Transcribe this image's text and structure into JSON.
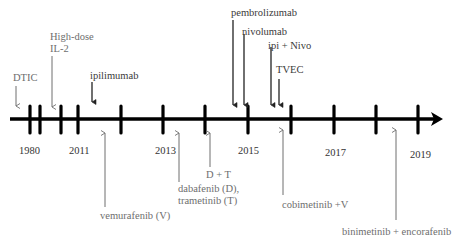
{
  "diagram": {
    "type": "timeline",
    "axis": {
      "y": 119,
      "x_start": 10,
      "x_end": 443,
      "color": "#000000"
    },
    "ticks_x": [
      30,
      40,
      61,
      78,
      121,
      163,
      205,
      248,
      291,
      334,
      376,
      418
    ],
    "year_labels": [
      {
        "text": "1980",
        "x": 19,
        "y": 145
      },
      {
        "text": "2011",
        "x": 69,
        "y": 145
      },
      {
        "text": "2013",
        "x": 155,
        "y": 145
      },
      {
        "text": "2015",
        "x": 238,
        "y": 145
      },
      {
        "text": "2017",
        "x": 325,
        "y": 147
      },
      {
        "text": "2019",
        "x": 410,
        "y": 149
      }
    ],
    "above": [
      {
        "lines": [
          "DTIC"
        ],
        "x": 14,
        "y": 72,
        "arrow_x": 16,
        "arrow_y1": 86,
        "arrow_y2": 106,
        "color": "#6e6e6e"
      },
      {
        "lines": [
          "High-dose",
          "IL-2"
        ],
        "x": 50,
        "y": 31,
        "arrow_x": 52,
        "arrow_y1": 56,
        "arrow_y2": 107,
        "color": "#6e6e6e"
      },
      {
        "lines": [
          "ipilimumab"
        ],
        "x": 90,
        "y": 70,
        "arrow_x": 92,
        "arrow_y1": 82,
        "arrow_y2": 102,
        "color": "#222222"
      },
      {
        "lines": [
          "pembrolizumab"
        ],
        "x": 231,
        "y": 7,
        "arrow_x": 233,
        "arrow_y1": 20,
        "arrow_y2": 105,
        "color": "#222222"
      },
      {
        "lines": [
          "nivolumab"
        ],
        "x": 243,
        "y": 26,
        "arrow_x": 244,
        "arrow_y1": 34,
        "arrow_y2": 105,
        "color": "#222222"
      },
      {
        "lines": [
          "ipi + Nivo"
        ],
        "x": 269,
        "y": 39,
        "arrow_x": 271,
        "arrow_y1": 47,
        "arrow_y2": 105,
        "color": "#222222"
      },
      {
        "lines": [
          "TVEC"
        ],
        "x": 276,
        "y": 64,
        "arrow_x": 279,
        "arrow_y1": 79,
        "arrow_y2": 105,
        "color": "#222222"
      }
    ],
    "below": [
      {
        "lines": [
          "vemurafenib (V)"
        ],
        "x": 100,
        "y": 209,
        "arrow_x": 105,
        "arrow_y1": 207,
        "arrow_y2": 133,
        "color": "#6e6e6e"
      },
      {
        "lines": [
          "dabafenib (D),",
          "trametinib (T)"
        ],
        "x": 178,
        "y": 182,
        "arrow_x": 179,
        "arrow_y1": 182,
        "arrow_y2": 133,
        "color": "#6e6e6e"
      },
      {
        "lines": [
          "D + T"
        ],
        "x": 206,
        "y": 169,
        "arrow_x": 210,
        "arrow_y1": 167,
        "arrow_y2": 133,
        "color": "#6e6e6e"
      },
      {
        "lines": [
          "cobimetinib +V"
        ],
        "x": 282,
        "y": 199,
        "arrow_x": 283,
        "arrow_y1": 195,
        "arrow_y2": 130,
        "color": "#6e6e6e"
      },
      {
        "lines": [
          "binimetinib + encorafenib"
        ],
        "x": 342,
        "y": 226,
        "arrow_x": 396,
        "arrow_y1": 220,
        "arrow_y2": 130,
        "color": "#6e6e6e"
      }
    ]
  },
  "text": {
    "years": [
      "1980",
      "2011",
      "2013",
      "2015",
      "2017",
      "2019"
    ],
    "dtic": "DTIC",
    "il2_line1": "High-dose",
    "il2_line2": "IL-2",
    "ipilimumab": "ipilimumab",
    "pembrolizumab": "pembrolizumab",
    "nivolumab": "nivolumab",
    "ipi_nivo": "ipi + Nivo",
    "tvec": "TVEC",
    "vemurafenib": "vemurafenib (V)",
    "dabrafenib_line1": "dabafenib (D),",
    "dabrafenib_line2": "trametinib (T)",
    "d_plus_t": "D + T",
    "cobimetinib": "cobimetinib +V",
    "binimetinib": "binimetinib + encorafenib"
  }
}
